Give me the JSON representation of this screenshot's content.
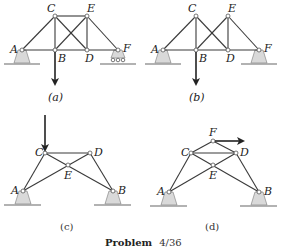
{
  "figure": {
    "caption": "Problem 4/36",
    "caption_prefix": "Problem",
    "caption_number": "4/36"
  },
  "panels": [
    {
      "id": "a",
      "label": "(a)",
      "nodes": {
        "A": [
          22,
          50
        ],
        "B": [
          55,
          50
        ],
        "C": [
          55,
          16
        ],
        "D": [
          87,
          50
        ],
        "E": [
          87,
          16
        ],
        "F": [
          118,
          50
        ]
      },
      "members": [
        [
          "A",
          "C"
        ],
        [
          "C",
          "E"
        ],
        [
          "E",
          "F"
        ],
        [
          "A",
          "B"
        ],
        [
          "B",
          "D"
        ],
        [
          "D",
          "F"
        ],
        [
          "C",
          "B"
        ],
        [
          "E",
          "D"
        ],
        [
          "C",
          "D"
        ],
        [
          "B",
          "E"
        ]
      ],
      "supports": [
        {
          "node": "A",
          "type": "pin"
        },
        {
          "node": "F",
          "type": "roller"
        }
      ],
      "load": {
        "node": "B",
        "direction": "down"
      }
    },
    {
      "id": "b",
      "label": "(b)",
      "nodes": {
        "A": [
          163,
          50
        ],
        "B": [
          196,
          50
        ],
        "C": [
          196,
          16
        ],
        "D": [
          228,
          50
        ],
        "E": [
          228,
          16
        ],
        "F": [
          259,
          50
        ]
      },
      "members": [
        [
          "A",
          "C"
        ],
        [
          "E",
          "F"
        ],
        [
          "A",
          "B"
        ],
        [
          "B",
          "D"
        ],
        [
          "D",
          "F"
        ],
        [
          "C",
          "B"
        ],
        [
          "E",
          "D"
        ],
        [
          "C",
          "D"
        ],
        [
          "B",
          "E"
        ]
      ],
      "supports": [
        {
          "node": "A",
          "type": "pin"
        },
        {
          "node": "F",
          "type": "pin"
        }
      ],
      "load": {
        "node": "B",
        "direction": "down"
      }
    },
    {
      "id": "c",
      "label": "(c)",
      "nodes": {
        "A": [
          23,
          191
        ],
        "B": [
          113,
          191
        ],
        "C": [
          45,
          153
        ],
        "D": [
          90,
          153
        ],
        "E": [
          68,
          165
        ]
      },
      "members": [
        [
          "A",
          "C"
        ],
        [
          "C",
          "D"
        ],
        [
          "D",
          "B"
        ],
        [
          "C",
          "E"
        ],
        [
          "E",
          "B"
        ],
        [
          "A",
          "E"
        ],
        [
          "E",
          "D"
        ]
      ],
      "supports": [
        {
          "node": "A",
          "type": "pin"
        },
        {
          "node": "B",
          "type": "pin"
        }
      ],
      "load": {
        "node": "C",
        "direction": "down"
      }
    },
    {
      "id": "d",
      "label": "(d)",
      "nodes": {
        "A": [
          169,
          192
        ],
        "B": [
          259,
          192
        ],
        "C": [
          191,
          153
        ],
        "D": [
          236,
          153
        ],
        "E": [
          213,
          165
        ],
        "F": [
          213,
          141
        ]
      },
      "members": [
        [
          "A",
          "C"
        ],
        [
          "C",
          "D"
        ],
        [
          "D",
          "B"
        ],
        [
          "C",
          "E"
        ],
        [
          "E",
          "B"
        ],
        [
          "A",
          "E"
        ],
        [
          "E",
          "D"
        ],
        [
          "C",
          "F"
        ],
        [
          "F",
          "D"
        ]
      ],
      "supports": [
        {
          "node": "A",
          "type": "pin"
        },
        {
          "node": "B",
          "type": "pin"
        }
      ],
      "load": {
        "node": "F",
        "direction": "right"
      }
    }
  ],
  "colors": {
    "member": "#3a3a3a",
    "support": "#d9d9d9",
    "arrow": "#222222"
  }
}
